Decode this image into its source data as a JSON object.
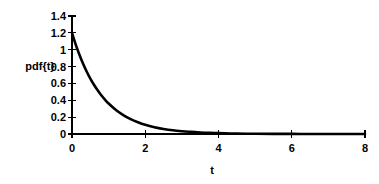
{
  "chart_data": {
    "type": "line",
    "title": "",
    "subtitle": "",
    "xlabel": "t",
    "ylabel": "pdf{t}",
    "xlim": [
      0,
      8
    ],
    "ylim": [
      0,
      1.4
    ],
    "grid": false,
    "legend": null,
    "x_ticks": [
      "0",
      "2",
      "4",
      "6",
      "8"
    ],
    "x_tick_values": [
      0,
      2,
      4,
      6,
      8
    ],
    "x_minor_tick_values": [
      1,
      3,
      5,
      7
    ],
    "y_ticks": [
      "0",
      "0.2",
      "0.4",
      "0.6",
      "0.8",
      "1",
      "1.2",
      "1.4"
    ],
    "y_tick_values": [
      0,
      0.2,
      0.4,
      0.6,
      0.8,
      1,
      1.2,
      1.4
    ],
    "series": [
      {
        "name": "pdf{t}",
        "color": "#000000",
        "x": [
          0,
          0.1,
          0.2,
          0.3,
          0.4,
          0.5,
          0.6,
          0.7,
          0.8,
          0.9,
          1,
          1.2,
          1.4,
          1.6,
          1.8,
          2,
          2.25,
          2.5,
          2.75,
          3,
          3.25,
          3.5,
          3.75,
          4,
          4.5,
          5,
          5.5,
          6,
          6.5,
          7,
          7.5,
          8
        ],
        "values": [
          1.2,
          1.064,
          0.944,
          0.837,
          0.742,
          0.658,
          0.584,
          0.518,
          0.459,
          0.407,
          0.361,
          0.284,
          0.224,
          0.176,
          0.139,
          0.109,
          0.081,
          0.06,
          0.044,
          0.033,
          0.025,
          0.018,
          0.013,
          0.01,
          0.005,
          0.003,
          0.002,
          0.001,
          0.0005,
          0.0003,
          0.0002,
          0.0001
        ]
      }
    ]
  }
}
